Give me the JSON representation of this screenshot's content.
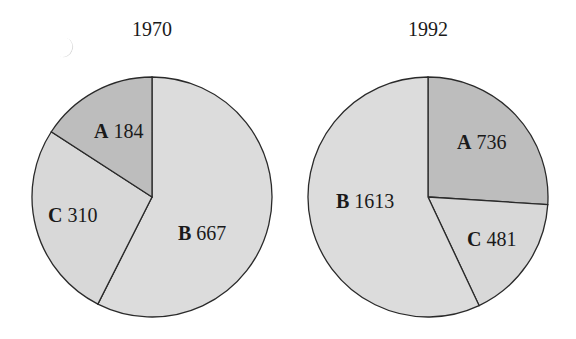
{
  "chart_data": [
    {
      "type": "pie",
      "title": "1970",
      "center": [
        152,
        197
      ],
      "radius": 120,
      "slices": [
        {
          "label": "A",
          "value": 184,
          "color": "#bdbdbd"
        },
        {
          "label": "B",
          "value": 667,
          "color": "#dcdcdc"
        },
        {
          "label": "C",
          "value": 310,
          "color": "#d8d8d8"
        }
      ]
    },
    {
      "type": "pie",
      "title": "1992",
      "center": [
        428,
        197
      ],
      "radius": 120,
      "slices": [
        {
          "label": "A",
          "value": 736,
          "color": "#bdbdbd"
        },
        {
          "label": "B",
          "value": 1613,
          "color": "#dcdcdc"
        },
        {
          "label": "C",
          "value": 481,
          "color": "#d8d8d8"
        }
      ]
    }
  ],
  "titles": [
    "1970",
    "1992"
  ],
  "labels": {
    "p1": {
      "a_key": "A",
      "a_val": " 184",
      "b_key": "B",
      "b_val": " 667",
      "c_key": "C",
      "c_val": " 310"
    },
    "p2": {
      "a_key": "A",
      "a_val": " 736",
      "b_key": "B",
      "b_val": " 1613",
      "c_key": "C",
      "c_val": " 481"
    }
  }
}
